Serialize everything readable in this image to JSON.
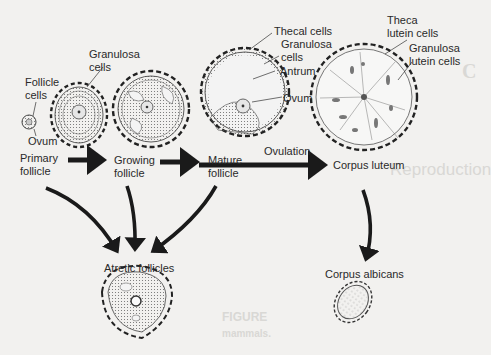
{
  "figure": {
    "stages": [
      {
        "id": "primary",
        "label_line1": "Primary",
        "label_line2": "follicle"
      },
      {
        "id": "growing",
        "label_line1": "Growing",
        "label_line2": "follicle"
      },
      {
        "id": "mature",
        "label_line1": "Mature",
        "label_line2": "follicle"
      },
      {
        "id": "corpus-luteum",
        "label": "Corpus luteum"
      },
      {
        "id": "atretic",
        "label": "Atretic follicles"
      },
      {
        "id": "corpus-albicans",
        "label": "Corpus albicans"
      }
    ],
    "callouts": {
      "follicle_cells_1": "Follicle",
      "follicle_cells_2": "cells",
      "ovum_primary": "Ovum",
      "granulosa_1": "Granulosa",
      "granulosa_2": "cells",
      "thecal_cells": "Thecal cells",
      "granulosa_mature_1": "Granulosa",
      "granulosa_mature_2": "cells",
      "antrum": "Antrum",
      "ovum_mature": "Ovum",
      "theca_lutein_1": "Theca",
      "theca_lutein_2": "lutein cells",
      "granulosa_lutein_1": "Granulosa",
      "granulosa_lutein_2": "lutein cells"
    },
    "transitions": {
      "ovulation": "Ovulation"
    },
    "arrows": [
      {
        "from": "primary",
        "to": "growing"
      },
      {
        "from": "growing",
        "to": "mature"
      },
      {
        "from": "mature",
        "to": "corpus-luteum",
        "label": "Ovulation"
      },
      {
        "from": "primary",
        "to": "atretic"
      },
      {
        "from": "growing",
        "to": "atretic"
      },
      {
        "from": "mature",
        "to": "atretic"
      },
      {
        "from": "corpus-luteum",
        "to": "corpus-albicans"
      }
    ]
  },
  "background_bleed": {
    "heading_1": "C",
    "heading_2": "Reproduction",
    "figure_caption": "FIGURE",
    "caption_word": "mammals."
  }
}
